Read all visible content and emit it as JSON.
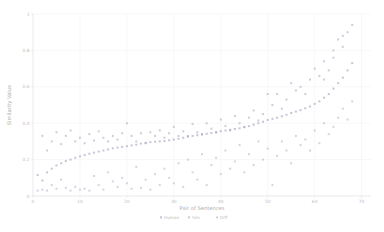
{
  "chart_data": {
    "type": "scatter",
    "title": "",
    "xlabel": "Pair of Sentences",
    "ylabel": "Similarity Value",
    "xlim": [
      0,
      72
    ],
    "ylim": [
      0,
      1.0
    ],
    "grid": true,
    "legend_position": "bottom",
    "xticks": [
      0,
      10,
      20,
      30,
      40,
      50,
      60,
      70
    ],
    "xticklabels": [
      "0",
      "10",
      "20",
      "30",
      "40",
      "50",
      "60",
      "70"
    ],
    "yticks": [
      0,
      0.2,
      0.4,
      0.6,
      0.8,
      1
    ],
    "yticklabels": [
      "0",
      "0.2",
      "0.4",
      "0.6",
      "0.8",
      "1"
    ],
    "legend": [
      {
        "name": "Human",
        "marker": "dot",
        "color": "#9b94b8"
      },
      {
        "name": "Sim",
        "marker": "dot",
        "color": "#a8a2c0"
      },
      {
        "name": "Diff",
        "marker": "dot",
        "color": "#b5b0c8"
      }
    ],
    "series": [
      {
        "name": "Human",
        "color": "#9b94b8",
        "marker": "dot",
        "points": [
          [
            1,
            0.115
          ],
          [
            2,
            0.085
          ],
          [
            3,
            0.13
          ],
          [
            4,
            0.15
          ],
          [
            5,
            0.168
          ],
          [
            6,
            0.18
          ],
          [
            7,
            0.192
          ],
          [
            8,
            0.2
          ],
          [
            9,
            0.21
          ],
          [
            10,
            0.218
          ],
          [
            11,
            0.225
          ],
          [
            12,
            0.232
          ],
          [
            13,
            0.238
          ],
          [
            14,
            0.244
          ],
          [
            15,
            0.25
          ],
          [
            16,
            0.256
          ],
          [
            17,
            0.262
          ],
          [
            18,
            0.266
          ],
          [
            19,
            0.27
          ],
          [
            20,
            0.274
          ],
          [
            21,
            0.278
          ],
          [
            22,
            0.282
          ],
          [
            23,
            0.288
          ],
          [
            24,
            0.292
          ],
          [
            25,
            0.296
          ],
          [
            26,
            0.298
          ],
          [
            27,
            0.3
          ],
          [
            28,
            0.302
          ],
          [
            29,
            0.306
          ],
          [
            30,
            0.31
          ],
          [
            31,
            0.314
          ],
          [
            32,
            0.32
          ],
          [
            33,
            0.326
          ],
          [
            34,
            0.33
          ],
          [
            35,
            0.334
          ],
          [
            36,
            0.338
          ],
          [
            37,
            0.342
          ],
          [
            38,
            0.346
          ],
          [
            39,
            0.35
          ],
          [
            40,
            0.356
          ],
          [
            41,
            0.36
          ],
          [
            42,
            0.364
          ],
          [
            43,
            0.368
          ],
          [
            44,
            0.372
          ],
          [
            45,
            0.378
          ],
          [
            46,
            0.384
          ],
          [
            47,
            0.392
          ],
          [
            48,
            0.4
          ],
          [
            49,
            0.408
          ],
          [
            50,
            0.418
          ],
          [
            51,
            0.424
          ],
          [
            52,
            0.43
          ],
          [
            53,
            0.438
          ],
          [
            54,
            0.446
          ],
          [
            55,
            0.456
          ],
          [
            56,
            0.464
          ],
          [
            57,
            0.472
          ],
          [
            58,
            0.482
          ],
          [
            59,
            0.492
          ],
          [
            60,
            0.506
          ],
          [
            61,
            0.52
          ],
          [
            62,
            0.54
          ],
          [
            63,
            0.56
          ],
          [
            64,
            0.59
          ],
          [
            65,
            0.62
          ],
          [
            66,
            0.65
          ],
          [
            67,
            0.69
          ],
          [
            68,
            0.73
          ]
        ]
      },
      {
        "name": "Sim",
        "color": "#a8a2c0",
        "marker": "dot",
        "points": [
          [
            2,
            0.33
          ],
          [
            3,
            0.25
          ],
          [
            4,
            0.3
          ],
          [
            5,
            0.35
          ],
          [
            6,
            0.285
          ],
          [
            7,
            0.33
          ],
          [
            8,
            0.36
          ],
          [
            9,
            0.3
          ],
          [
            10,
            0.32
          ],
          [
            11,
            0.29
          ],
          [
            12,
            0.34
          ],
          [
            13,
            0.305
          ],
          [
            14,
            0.355
          ],
          [
            15,
            0.32
          ],
          [
            16,
            0.3
          ],
          [
            17,
            0.33
          ],
          [
            18,
            0.31
          ],
          [
            19,
            0.345
          ],
          [
            20,
            0.4
          ],
          [
            21,
            0.33
          ],
          [
            22,
            0.3
          ],
          [
            23,
            0.345
          ],
          [
            24,
            0.29
          ],
          [
            25,
            0.35
          ],
          [
            26,
            0.33
          ],
          [
            27,
            0.36
          ],
          [
            28,
            0.32
          ],
          [
            29,
            0.345
          ],
          [
            30,
            0.38
          ],
          [
            31,
            0.33
          ],
          [
            32,
            0.355
          ],
          [
            33,
            0.33
          ],
          [
            34,
            0.395
          ],
          [
            35,
            0.35
          ],
          [
            36,
            0.34
          ],
          [
            37,
            0.4
          ],
          [
            38,
            0.37
          ],
          [
            39,
            0.35
          ],
          [
            40,
            0.42
          ],
          [
            41,
            0.385
          ],
          [
            42,
            0.36
          ],
          [
            43,
            0.44
          ],
          [
            44,
            0.4
          ],
          [
            45,
            0.38
          ],
          [
            46,
            0.43
          ],
          [
            47,
            0.47
          ],
          [
            48,
            0.415
          ],
          [
            49,
            0.45
          ],
          [
            50,
            0.56
          ],
          [
            51,
            0.5
          ],
          [
            52,
            0.56
          ],
          [
            53,
            0.48
          ],
          [
            54,
            0.53
          ],
          [
            55,
            0.62
          ],
          [
            56,
            0.58
          ],
          [
            57,
            0.6
          ],
          [
            58,
            0.56
          ],
          [
            59,
            0.64
          ],
          [
            60,
            0.7
          ],
          [
            61,
            0.66
          ],
          [
            62,
            0.74
          ],
          [
            63,
            0.69
          ],
          [
            64,
            0.8
          ],
          [
            65,
            0.86
          ],
          [
            66,
            0.82
          ],
          [
            67,
            0.9
          ],
          [
            68,
            0.94
          ],
          [
            66,
            0.88
          ],
          [
            64,
            0.76
          ],
          [
            62,
            0.64
          ]
        ]
      },
      {
        "name": "Diff",
        "color": "#b5b0c8",
        "marker": "dot",
        "points": [
          [
            1,
            0.03
          ],
          [
            2,
            0.035
          ],
          [
            3,
            0.03
          ],
          [
            4,
            0.06
          ],
          [
            5,
            0.04
          ],
          [
            6,
            0.09
          ],
          [
            7,
            0.045
          ],
          [
            8,
            0.03
          ],
          [
            9,
            0.05
          ],
          [
            10,
            0.035
          ],
          [
            11,
            0.04
          ],
          [
            12,
            0.03
          ],
          [
            13,
            0.11
          ],
          [
            14,
            0.06
          ],
          [
            15,
            0.035
          ],
          [
            16,
            0.13
          ],
          [
            17,
            0.08
          ],
          [
            18,
            0.05
          ],
          [
            19,
            0.1
          ],
          [
            20,
            0.07
          ],
          [
            21,
            0.04
          ],
          [
            22,
            0.16
          ],
          [
            23,
            0.045
          ],
          [
            24,
            0.09
          ],
          [
            25,
            0.035
          ],
          [
            26,
            0.12
          ],
          [
            27,
            0.06
          ],
          [
            28,
            0.15
          ],
          [
            29,
            0.1
          ],
          [
            30,
            0.07
          ],
          [
            31,
            0.18
          ],
          [
            32,
            0.05
          ],
          [
            33,
            0.2
          ],
          [
            34,
            0.13
          ],
          [
            35,
            0.09
          ],
          [
            36,
            0.23
          ],
          [
            37,
            0.06
          ],
          [
            38,
            0.17
          ],
          [
            39,
            0.21
          ],
          [
            40,
            0.12
          ],
          [
            41,
            0.25
          ],
          [
            42,
            0.15
          ],
          [
            43,
            0.19
          ],
          [
            44,
            0.28
          ],
          [
            45,
            0.13
          ],
          [
            46,
            0.23
          ],
          [
            47,
            0.17
          ],
          [
            48,
            0.3
          ],
          [
            49,
            0.2
          ],
          [
            50,
            0.26
          ],
          [
            51,
            0.06
          ],
          [
            52,
            0.22
          ],
          [
            53,
            0.3
          ],
          [
            54,
            0.25
          ],
          [
            55,
            0.18
          ],
          [
            56,
            0.33
          ],
          [
            57,
            0.28
          ],
          [
            58,
            0.31
          ],
          [
            59,
            0.25
          ],
          [
            60,
            0.36
          ],
          [
            61,
            0.29
          ],
          [
            62,
            0.4
          ],
          [
            63,
            0.34
          ],
          [
            64,
            0.38
          ],
          [
            65,
            0.43
          ],
          [
            66,
            0.48
          ],
          [
            67,
            0.42
          ],
          [
            68,
            0.52
          ]
        ]
      }
    ]
  }
}
